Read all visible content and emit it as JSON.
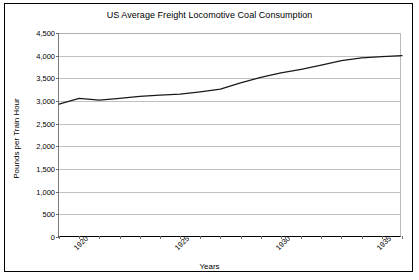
{
  "chart_data": {
    "type": "line",
    "title": "US Average Freight Locomotive Coal Consumption",
    "xlabel": "Years",
    "ylabel": "Pounds per Train Hour",
    "xlim": [
      1920,
      1937
    ],
    "ylim": [
      0,
      4500
    ],
    "ytick_step": 500,
    "yticks": [
      0,
      500,
      1000,
      1500,
      2000,
      2500,
      3000,
      3500,
      4000,
      4500
    ],
    "ytick_labels": [
      "0",
      "500",
      "1,000",
      "1,500",
      "2,000",
      "2,500",
      "3,000",
      "3,500",
      "4,000",
      "4,500"
    ],
    "xticks": [
      1920,
      1921,
      1922,
      1923,
      1924,
      1925,
      1926,
      1927,
      1928,
      1929,
      1930,
      1931,
      1932,
      1933,
      1934,
      1935,
      1936,
      1937
    ],
    "xtick_labels_shown": [
      "1920",
      "1925",
      "1930",
      "1935"
    ],
    "xtick_labels_shown_values": [
      1920,
      1925,
      1930,
      1935
    ],
    "grid": "horizontal",
    "legend": "none",
    "line_color": "#1a1a1a",
    "x": [
      1920,
      1921,
      1922,
      1923,
      1924,
      1925,
      1926,
      1927,
      1928,
      1929,
      1930,
      1931,
      1932,
      1933,
      1934,
      1935,
      1936,
      1937
    ],
    "values": [
      2930,
      3060,
      3020,
      3060,
      3100,
      3130,
      3150,
      3200,
      3260,
      3400,
      3520,
      3620,
      3700,
      3790,
      3890,
      3950,
      3980,
      4000
    ],
    "series": [
      {
        "name": "Average coal consumption",
        "values": [
          2930,
          3060,
          3020,
          3060,
          3100,
          3130,
          3150,
          3200,
          3260,
          3400,
          3520,
          3620,
          3700,
          3790,
          3890,
          3950,
          3980,
          4000
        ]
      }
    ]
  }
}
